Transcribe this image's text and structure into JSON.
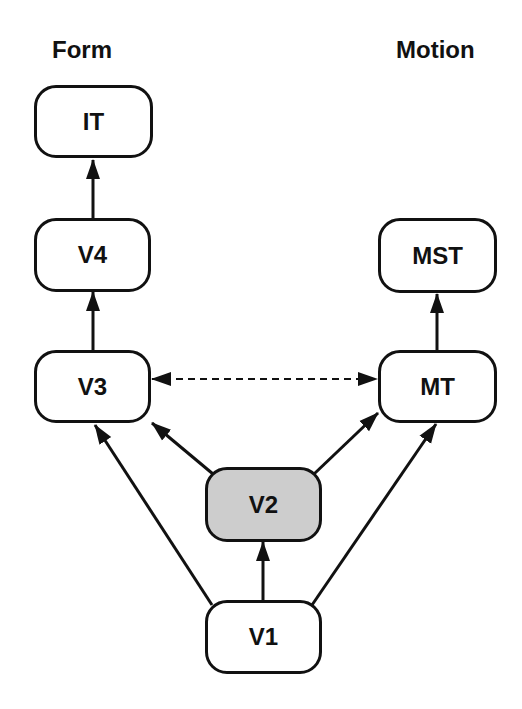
{
  "columns": {
    "form": "Form",
    "motion": "Motion"
  },
  "nodes": {
    "it": {
      "label": "IT"
    },
    "v4": {
      "label": "V4"
    },
    "v3": {
      "label": "V3"
    },
    "mst": {
      "label": "MST"
    },
    "mt": {
      "label": "MT"
    },
    "v2": {
      "label": "V2",
      "highlighted": true,
      "fill": "#cdcdcd"
    },
    "v1": {
      "label": "V1"
    }
  },
  "edges": [
    {
      "from": "V4",
      "to": "IT",
      "style": "solid"
    },
    {
      "from": "V3",
      "to": "V4",
      "style": "solid"
    },
    {
      "from": "MT",
      "to": "MST",
      "style": "solid"
    },
    {
      "from": "V1",
      "to": "V2",
      "style": "solid"
    },
    {
      "from": "V1",
      "to": "V3",
      "style": "solid"
    },
    {
      "from": "V1",
      "to": "MT",
      "style": "solid"
    },
    {
      "from": "V2",
      "to": "V3",
      "style": "solid"
    },
    {
      "from": "V2",
      "to": "MT",
      "style": "solid"
    },
    {
      "from": "V3",
      "to": "MT",
      "style": "dashed",
      "bidirectional": true
    }
  ]
}
